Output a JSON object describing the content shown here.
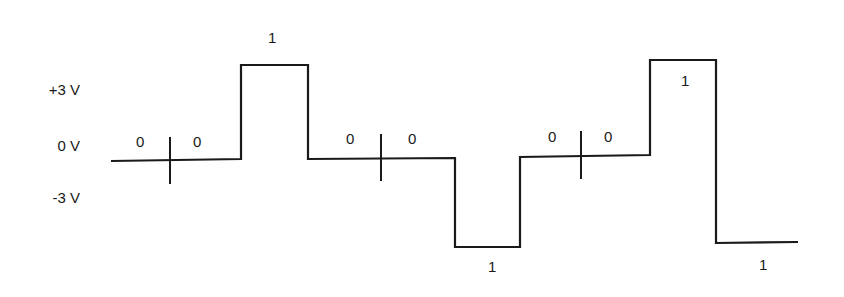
{
  "diagram": {
    "type": "line-coding-waveform",
    "stroke_color": "#1a1a1a",
    "axis_labels": [
      {
        "text": "+3 V",
        "x": 38,
        "y": 89
      },
      {
        "text": "0 V",
        "x": 38,
        "y": 145
      },
      {
        "text": "-3 V",
        "x": 38,
        "y": 197
      }
    ],
    "levels": {
      "plus": 65,
      "zero": 160,
      "minus": 247
    },
    "bit_labels": [
      {
        "text": "0",
        "x": 136,
        "y": 137
      },
      {
        "text": "0",
        "x": 193,
        "y": 137
      },
      {
        "text": "1",
        "x": 268,
        "y": 31
      },
      {
        "text": "0",
        "x": 345,
        "y": 133
      },
      {
        "text": "0",
        "x": 408,
        "y": 133
      },
      {
        "text": "1",
        "x": 488,
        "y": 261
      },
      {
        "text": "0",
        "x": 548,
        "y": 131
      },
      {
        "text": "0",
        "x": 605,
        "y": 131
      },
      {
        "text": "1",
        "x": 681,
        "y": 72
      },
      {
        "text": "1",
        "x": 759,
        "y": 259
      }
    ],
    "bits": [
      "0",
      "0",
      "1",
      "0",
      "0",
      "1",
      "0",
      "0",
      "1",
      "1"
    ],
    "waveform_points": "111,161 241,159 241,65 308,65 308,159 455,158 455,247 520,247 520,157 650,155 650,60 716,60 716,243 798,242",
    "ticks": [
      {
        "x": 170,
        "y1": 137,
        "y2": 184
      },
      {
        "x": 381,
        "y1": 134,
        "y2": 181
      },
      {
        "x": 581,
        "y1": 131,
        "y2": 179
      }
    ]
  }
}
